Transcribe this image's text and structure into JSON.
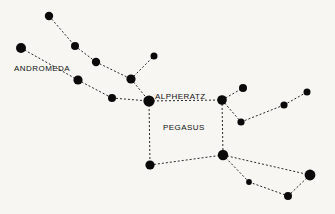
{
  "chart_data": {
    "type": "scatter",
    "title": "",
    "subtitle": "",
    "xlabel": "",
    "ylabel": "",
    "grid": false,
    "legend": "none",
    "background_color": "#f7f6f3",
    "star_color": "#0a0a0a",
    "line_color": "#111111",
    "line_style": "dashed",
    "xlim": [
      0,
      335
    ],
    "ylim": [
      0,
      214
    ],
    "labels": [
      {
        "id": "andromeda",
        "text": "ANDROMEDA",
        "x": 14,
        "y": 71,
        "anchor": "start"
      },
      {
        "id": "alpheratz",
        "text": "ALPHERATZ",
        "x": 155,
        "y": 99,
        "anchor": "start"
      },
      {
        "id": "pegasus",
        "text": "PEGASUS",
        "x": 163,
        "y": 130,
        "anchor": "start"
      }
    ],
    "stars": [
      {
        "id": "and-a1",
        "x": 49,
        "y": 16,
        "r": 4.2
      },
      {
        "id": "and-a2",
        "x": 75,
        "y": 46,
        "r": 4.0
      },
      {
        "id": "and-a3",
        "x": 96,
        "y": 62,
        "r": 4.2
      },
      {
        "id": "and-a4",
        "x": 131,
        "y": 79,
        "r": 4.6
      },
      {
        "id": "and-spur",
        "x": 154,
        "y": 56,
        "r": 3.5
      },
      {
        "id": "and-b1",
        "x": 21,
        "y": 48,
        "r": 5.0
      },
      {
        "id": "and-b2",
        "x": 78,
        "y": 80,
        "r": 4.6
      },
      {
        "id": "and-b3",
        "x": 112,
        "y": 98,
        "r": 4.0
      },
      {
        "id": "alpheratz",
        "x": 149,
        "y": 101,
        "r": 5.6
      },
      {
        "id": "scheat",
        "x": 222,
        "y": 100,
        "r": 4.8
      },
      {
        "id": "peg-up",
        "x": 243,
        "y": 88,
        "r": 4.0
      },
      {
        "id": "peg-mid",
        "x": 241,
        "y": 122,
        "r": 3.6
      },
      {
        "id": "peg-e1",
        "x": 284,
        "y": 105,
        "r": 3.6
      },
      {
        "id": "peg-e2",
        "x": 307,
        "y": 92,
        "r": 3.5
      },
      {
        "id": "algenib",
        "x": 150,
        "y": 165,
        "r": 4.6
      },
      {
        "id": "markab",
        "x": 223,
        "y": 155,
        "r": 5.2
      },
      {
        "id": "peg-s1",
        "x": 249,
        "y": 182,
        "r": 2.9
      },
      {
        "id": "peg-s2",
        "x": 288,
        "y": 196,
        "r": 4.0
      },
      {
        "id": "peg-s3",
        "x": 310,
        "y": 175,
        "r": 5.4
      }
    ],
    "lines": [
      {
        "id": "l-and-a1-a2",
        "from": "and-a1",
        "to": "and-a2"
      },
      {
        "id": "l-and-a2-a3",
        "from": "and-a2",
        "to": "and-a3"
      },
      {
        "id": "l-and-a3-a4",
        "from": "and-a3",
        "to": "and-a4"
      },
      {
        "id": "l-and-a4-spur",
        "from": "and-a4",
        "to": "and-spur"
      },
      {
        "id": "l-and-a4-alpheratz",
        "from": "and-a4",
        "to": "alpheratz"
      },
      {
        "id": "l-and-b1-b2",
        "from": "and-b1",
        "to": "and-b2"
      },
      {
        "id": "l-and-b2-b3",
        "from": "and-b2",
        "to": "and-b3"
      },
      {
        "id": "l-and-b3-alpheratz",
        "from": "and-b3",
        "to": "alpheratz"
      },
      {
        "id": "l-square-top",
        "from": "alpheratz",
        "to": "scheat"
      },
      {
        "id": "l-square-left",
        "from": "alpheratz",
        "to": "algenib"
      },
      {
        "id": "l-square-right",
        "from": "scheat",
        "to": "markab"
      },
      {
        "id": "l-square-bottom",
        "from": "algenib",
        "to": "markab"
      },
      {
        "id": "l-scheat-up",
        "from": "scheat",
        "to": "peg-up"
      },
      {
        "id": "l-scheat-mid",
        "from": "scheat",
        "to": "peg-mid"
      },
      {
        "id": "l-mid-e1",
        "from": "peg-mid",
        "to": "peg-e1"
      },
      {
        "id": "l-e1-e2",
        "from": "peg-e1",
        "to": "peg-e2"
      },
      {
        "id": "l-markab-s1",
        "from": "markab",
        "to": "peg-s1"
      },
      {
        "id": "l-s1-s2",
        "from": "peg-s1",
        "to": "peg-s2"
      },
      {
        "id": "l-s2-s3",
        "from": "peg-s2",
        "to": "peg-s3"
      },
      {
        "id": "l-markab-s3",
        "from": "markab",
        "to": "peg-s3"
      }
    ]
  }
}
